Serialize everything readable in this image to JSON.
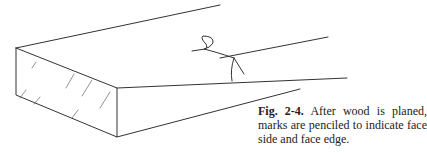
{
  "figure": {
    "label": "Fig. 2-4.",
    "caption_text": " After wood is planed, marks are penciled to indicate face side and face edge.",
    "line_color": "#333333",
    "background": "#ffffff"
  }
}
